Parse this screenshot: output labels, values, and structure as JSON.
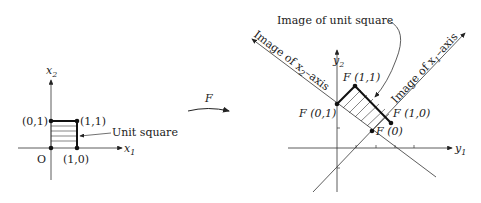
{
  "left": {
    "axis_x1": "x",
    "axis_x1_sub": "1",
    "axis_x2": "x",
    "axis_x2_sub": "2",
    "origin": "O",
    "p01": "(0,1)",
    "p11": "(1,1)",
    "p10": "(1,0)",
    "unit_square": "Unit square"
  },
  "map_label": "F",
  "right": {
    "axis_y1": "y",
    "axis_y1_sub": "1",
    "axis_y2": "y",
    "axis_y2_sub": "2",
    "image_unit_square": "Image of unit square",
    "image_x2_axis_prefix": "Image of x",
    "image_x2_axis_sub": "2",
    "image_x2_axis_suffix": "–axis",
    "image_x1_axis_prefix": "Image of x",
    "image_x1_axis_sub": "1",
    "image_x1_axis_suffix": "–axis",
    "F01": "F (0,1)",
    "F11": "F (1,1)",
    "F10": "F (1,0)",
    "F0": "F (0)"
  }
}
